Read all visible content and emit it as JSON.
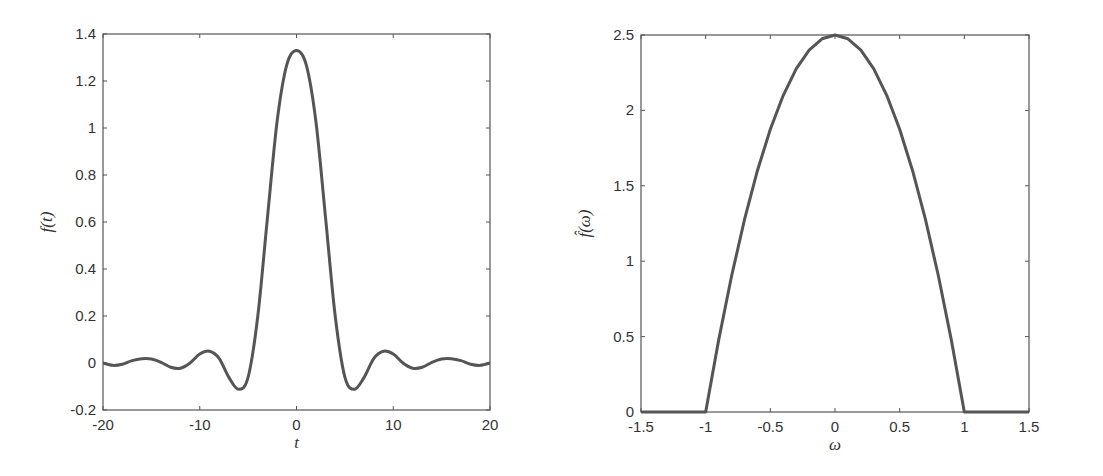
{
  "chart_data": [
    {
      "type": "line",
      "title": "",
      "xlabel": "t",
      "ylabel": "f(t)",
      "xlim": [
        -20,
        20
      ],
      "ylim": [
        -0.2,
        1.4
      ],
      "xticks": [
        -20,
        -10,
        0,
        10,
        20
      ],
      "xtick_labels": [
        "-20",
        "-10",
        "0",
        "10",
        "20"
      ],
      "yticks": [
        -0.2,
        0,
        0.2,
        0.4,
        0.6,
        0.8,
        1,
        1.2,
        1.4
      ],
      "ytick_labels": [
        "-0.2",
        "0",
        "0.2",
        "0.4",
        "0.6",
        "0.8",
        "1",
        "1.2",
        "1.4"
      ],
      "grid": false,
      "legend": null,
      "series": [
        {
          "name": "f(t)",
          "color": "#555555",
          "x": [
            -20,
            -19,
            -18,
            -17,
            -16,
            -15,
            -14,
            -13,
            -12,
            -11,
            -10,
            -9,
            -8,
            -7,
            -6,
            -5,
            -4,
            -3,
            -2,
            -1,
            0,
            1,
            2,
            3,
            4,
            5,
            6,
            7,
            8,
            9,
            10,
            11,
            12,
            13,
            14,
            15,
            16,
            17,
            18,
            19,
            20
          ],
          "y": [
            0.0,
            -0.01,
            -0.005,
            0.01,
            0.018,
            0.017,
            0.003,
            -0.018,
            -0.022,
            0.0,
            0.038,
            0.05,
            0.02,
            -0.06,
            -0.112,
            -0.06,
            0.2,
            0.62,
            1.03,
            1.27,
            1.33,
            1.27,
            1.03,
            0.62,
            0.2,
            -0.06,
            -0.112,
            -0.06,
            0.02,
            0.05,
            0.038,
            0.0,
            -0.022,
            -0.018,
            0.003,
            0.017,
            0.018,
            0.01,
            -0.005,
            -0.01,
            0.0
          ]
        }
      ],
      "annotations": []
    },
    {
      "type": "line",
      "title": "",
      "xlabel": "ω",
      "ylabel": "f̂(ω)",
      "xlim": [
        -1.5,
        1.5
      ],
      "ylim": [
        0,
        2.5
      ],
      "xticks": [
        -1.5,
        -1,
        -0.5,
        0,
        0.5,
        1,
        1.5
      ],
      "xtick_labels": [
        "-1.5",
        "-1",
        "-0.5",
        "0",
        "0.5",
        "1",
        "1.5"
      ],
      "yticks": [
        0,
        0.5,
        1,
        1.5,
        2,
        2.5
      ],
      "ytick_labels": [
        "0",
        "0.5",
        "1",
        "1.5",
        "2",
        "2.5"
      ],
      "grid": false,
      "legend": null,
      "series": [
        {
          "name": "f̂(ω)",
          "color": "#555555",
          "x": [
            -1.5,
            -1.0,
            -0.9,
            -0.8,
            -0.7,
            -0.6,
            -0.5,
            -0.4,
            -0.3,
            -0.2,
            -0.1,
            0.0,
            0.1,
            0.2,
            0.3,
            0.4,
            0.5,
            0.6,
            0.7,
            0.8,
            0.9,
            1.0,
            1.5
          ],
          "y": [
            0,
            0,
            0.475,
            0.9,
            1.275,
            1.6,
            1.875,
            2.1,
            2.275,
            2.4,
            2.475,
            2.5,
            2.475,
            2.4,
            2.275,
            2.1,
            1.875,
            1.6,
            1.275,
            0.9,
            0.475,
            0,
            0
          ]
        }
      ],
      "annotations": []
    }
  ]
}
